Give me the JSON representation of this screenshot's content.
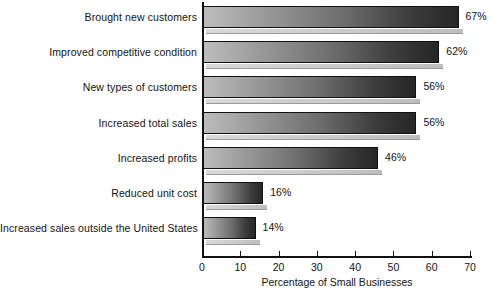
{
  "chart_data": {
    "type": "bar",
    "orientation": "horizontal",
    "title": "",
    "xlabel": "Percentage of Small Businesses",
    "ylabel": "",
    "xlim": [
      0,
      70
    ],
    "xticks": [
      0,
      10,
      20,
      30,
      40,
      50,
      60,
      70
    ],
    "grid": false,
    "legend": false,
    "categories": [
      "Brought new customers",
      "Improved competitive condition",
      "New types of customers",
      "Increased total sales",
      "Increased profits",
      "Reduced unit cost",
      "Increased sales outside the United States"
    ],
    "values": [
      67,
      62,
      56,
      56,
      46,
      16,
      14
    ],
    "data_labels": [
      "67%",
      "62%",
      "56%",
      "56%",
      "46%",
      "16%",
      "14%"
    ]
  },
  "style": {
    "bar_gradient_start": "#bdbdbd",
    "bar_gradient_end": "#262626",
    "bar_border": "#111111",
    "shadow_color": "#cfcfcf",
    "axis_color": "#111111",
    "text_color": "#131313",
    "background": "#ffffff"
  }
}
